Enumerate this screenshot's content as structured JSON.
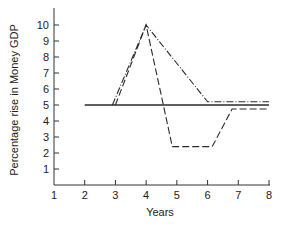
{
  "chart_data": {
    "type": "line",
    "title": "",
    "xlabel": "Years",
    "ylabel": "Percentage rise in Money GDP",
    "xlim": [
      1,
      8
    ],
    "ylim": [
      0,
      10
    ],
    "x_ticks": [
      1,
      2,
      3,
      4,
      5,
      6,
      7,
      8
    ],
    "y_ticks": [
      1,
      2,
      3,
      4,
      5,
      6,
      7,
      8,
      9,
      10
    ],
    "grid": false,
    "legend": null,
    "series": [
      {
        "name": "solid",
        "style": "solid",
        "x": [
          2,
          8
        ],
        "y": [
          5,
          5
        ]
      },
      {
        "name": "dash-dot",
        "style": "dash-dot",
        "x": [
          2.9,
          4,
          6,
          8
        ],
        "y": [
          5,
          10,
          5.2,
          5.2
        ]
      },
      {
        "name": "dashed",
        "style": "dashed",
        "x": [
          3,
          4,
          4.85,
          6.15,
          6.8,
          8
        ],
        "y": [
          5,
          10,
          2.4,
          2.4,
          4.75,
          4.75
        ]
      }
    ]
  },
  "colors": {
    "line": "#2a2a2a",
    "axis": "#333333",
    "background": "#ffffff"
  }
}
